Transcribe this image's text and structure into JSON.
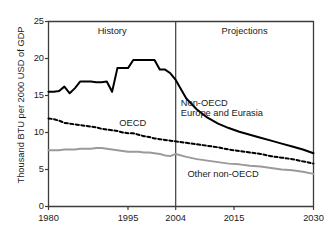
{
  "chart_data": {
    "type": "line",
    "title": "",
    "xlabel": "",
    "ylabel": "Thousand BTU per 2000 USD of GDP",
    "xlim": [
      1980,
      2030
    ],
    "ylim": [
      0,
      25
    ],
    "yticks": [
      0,
      5,
      10,
      15,
      20,
      25
    ],
    "ytick_labels": [
      "0",
      "5",
      "10",
      "15",
      "20",
      "25"
    ],
    "xticks": [
      1980,
      1995,
      2004,
      2015,
      2030
    ],
    "xtick_labels": [
      "1980",
      "1995",
      "2004",
      "2015",
      "2030"
    ],
    "grid": false,
    "legend_position": "inline-annotations",
    "history_projection_divider": 2004,
    "annotations": [
      {
        "name": "history",
        "text": "History",
        "x": 1992,
        "y": 23.6
      },
      {
        "name": "projections",
        "text": "Projections",
        "x": 2017,
        "y": 23.6
      },
      {
        "name": "non-oecd-europe-and-eurasia",
        "text_line1": "Non-OECD",
        "text_line2": "Europe and Eurasia",
        "x": 2011,
        "y": 13.2
      },
      {
        "name": "oecd",
        "text": "OECD",
        "x": 1996,
        "y": 11.2
      },
      {
        "name": "other-non-oecd",
        "text": "Other non-OECD",
        "x": 2013,
        "y": 4.3
      }
    ],
    "x": [
      1980,
      1981,
      1982,
      1983,
      1984,
      1985,
      1986,
      1987,
      1988,
      1989,
      1990,
      1991,
      1992,
      1993,
      1994,
      1995,
      1996,
      1997,
      1998,
      1999,
      2000,
      2001,
      2002,
      2003,
      2004,
      2006,
      2008,
      2010,
      2012,
      2014,
      2016,
      2018,
      2020,
      2022,
      2024,
      2026,
      2028,
      2030
    ],
    "series": [
      {
        "name": "Non-OECD Europe and Eurasia",
        "color": "#000000",
        "style": "solid",
        "values": [
          15.5,
          15.5,
          15.6,
          16.2,
          15.3,
          16.0,
          16.9,
          16.9,
          16.9,
          16.8,
          16.8,
          16.9,
          15.5,
          18.7,
          18.7,
          18.7,
          19.8,
          19.8,
          19.8,
          19.8,
          19.8,
          18.5,
          18.5,
          18.0,
          17.1,
          14.6,
          13.1,
          12.0,
          11.2,
          10.6,
          10.1,
          9.7,
          9.3,
          8.9,
          8.5,
          8.1,
          7.7,
          7.2
        ]
      },
      {
        "name": "OECD",
        "color": "#000000",
        "style": "dashed",
        "values": [
          11.9,
          11.8,
          11.6,
          11.3,
          11.2,
          11.1,
          11.0,
          10.9,
          10.8,
          10.7,
          10.5,
          10.4,
          10.3,
          10.2,
          10.0,
          9.9,
          9.9,
          9.7,
          9.5,
          9.4,
          9.2,
          9.1,
          9.0,
          8.9,
          8.8,
          8.6,
          8.4,
          8.2,
          8.0,
          7.7,
          7.5,
          7.3,
          7.1,
          6.8,
          6.6,
          6.4,
          6.1,
          5.8
        ]
      },
      {
        "name": "Other non-OECD",
        "color": "#9a9a9a",
        "style": "solid",
        "values": [
          7.6,
          7.6,
          7.6,
          7.7,
          7.7,
          7.7,
          7.8,
          7.8,
          7.8,
          7.9,
          7.9,
          7.8,
          7.7,
          7.6,
          7.5,
          7.4,
          7.4,
          7.4,
          7.3,
          7.3,
          7.2,
          7.1,
          6.9,
          6.8,
          7.1,
          6.7,
          6.4,
          6.2,
          6.0,
          5.8,
          5.7,
          5.5,
          5.4,
          5.2,
          5.0,
          4.9,
          4.7,
          4.4
        ]
      }
    ]
  },
  "axes": {
    "ylabel": "Thousand BTU per 2000 USD of GDP",
    "ytick_labels": [
      "25",
      "20",
      "15",
      "10",
      "5",
      "0"
    ],
    "xtick_labels": [
      "1980",
      "1995",
      "2004",
      "2015",
      "2030"
    ]
  },
  "labels": {
    "history": "History",
    "projections": "Projections",
    "non_oecd_line1": "Non-OECD",
    "non_oecd_line2": "Europe and Eurasia",
    "oecd": "OECD",
    "other_non_oecd": "Other non-OECD"
  },
  "colors": {
    "axis": "#3c3c3c",
    "black_series": "#000000",
    "gray_series": "#9a9a9a",
    "text": "#1a1a1a",
    "background": "#ffffff"
  }
}
